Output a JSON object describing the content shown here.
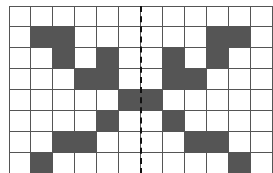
{
  "grid": {
    "rows": 8,
    "cols": 12,
    "cell_width": 22,
    "cell_height": 21,
    "fill_color": "#555555",
    "empty_color": "#ffffff",
    "line_color": "#555555",
    "filled_cells": [
      [
        1,
        1
      ],
      [
        1,
        2
      ],
      [
        1,
        9
      ],
      [
        1,
        10
      ],
      [
        2,
        2
      ],
      [
        2,
        4
      ],
      [
        2,
        7
      ],
      [
        2,
        9
      ],
      [
        3,
        3
      ],
      [
        3,
        4
      ],
      [
        3,
        7
      ],
      [
        3,
        8
      ],
      [
        4,
        5
      ],
      [
        4,
        6
      ],
      [
        5,
        4
      ],
      [
        5,
        7
      ],
      [
        6,
        2
      ],
      [
        6,
        3
      ],
      [
        6,
        8
      ],
      [
        6,
        9
      ],
      [
        7,
        1
      ],
      [
        7,
        10
      ]
    ]
  },
  "symmetry_axis": {
    "type": "dashed-vertical-line",
    "between_cols": [
      5,
      6
    ],
    "color": "#111111"
  }
}
